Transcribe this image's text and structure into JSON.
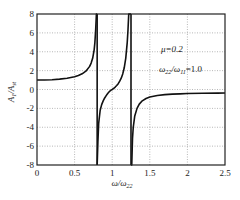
{
  "chart_data": {
    "type": "line",
    "title": "",
    "xlabel": "ω/ω22",
    "ylabel": "A1/Ast",
    "xlim": [
      0,
      2.5
    ],
    "ylim": [
      -8,
      8
    ],
    "xticks": [
      0,
      0.5,
      1,
      1.5,
      2,
      2.5
    ],
    "xtick_labels": [
      "0",
      "0.5",
      "1",
      "1.5",
      "2",
      "2.5"
    ],
    "yticks": [
      -8,
      -6,
      -4,
      -2,
      0,
      2,
      4,
      6,
      8
    ],
    "ytick_labels": [
      "-8",
      "-6",
      "-4",
      "-2",
      "0",
      "2",
      "4",
      "6",
      "8"
    ],
    "grid": true,
    "grid_style": "dotted",
    "legend": null,
    "annotations": [
      {
        "text": "μ=0.2",
        "x": 1.7,
        "y": 3.6
      },
      {
        "text": "ω22/ω11=1.0",
        "x": 1.7,
        "y": 1.3
      }
    ],
    "series": [
      {
        "name": "A1/Ast",
        "color": "#111111",
        "x": [
          0,
          0.1,
          0.2,
          0.3,
          0.4,
          0.5,
          0.55,
          0.6,
          0.65,
          0.7,
          0.72,
          0.74,
          0.76,
          0.77,
          0.78,
          0.79,
          0.8,
          0.8,
          0.81,
          0.82,
          0.84,
          0.86,
          0.88,
          0.9,
          0.92,
          0.94,
          0.96,
          0.98,
          1.0,
          1.02,
          1.04,
          1.06,
          1.08,
          1.1,
          1.12,
          1.14,
          1.16,
          1.18,
          1.2,
          1.21,
          1.22,
          1.23,
          1.24,
          1.25,
          1.25,
          1.26,
          1.27,
          1.28,
          1.3,
          1.33,
          1.36,
          1.4,
          1.45,
          1.5,
          1.6,
          1.7,
          1.8,
          1.9,
          2.0,
          2.2,
          2.4,
          2.5
        ],
        "values": [
          1.0,
          1.01,
          1.04,
          1.1,
          1.2,
          1.36,
          1.48,
          1.66,
          1.94,
          2.45,
          2.8,
          3.3,
          4.2,
          5.0,
          6.3,
          8.0,
          8.0,
          -8.0,
          -5.5,
          -3.6,
          -2.2,
          -1.6,
          -1.2,
          -0.9,
          -0.65,
          -0.42,
          -0.24,
          -0.1,
          0.0,
          0.12,
          0.26,
          0.42,
          0.62,
          0.88,
          1.2,
          1.65,
          2.3,
          3.3,
          5.0,
          6.3,
          8.0,
          8.0,
          8.0,
          8.0,
          -8.0,
          -8.0,
          -5.2,
          -4.0,
          -2.8,
          -2.0,
          -1.55,
          -1.2,
          -0.95,
          -0.8,
          -0.63,
          -0.54,
          -0.49,
          -0.46,
          -0.43,
          -0.4,
          -0.38,
          -0.37
        ]
      }
    ],
    "vertical_segments": [
      {
        "x": 0.8,
        "y_from": 8,
        "y_to": -8
      },
      {
        "x": 1.25,
        "y_from": 8,
        "y_to": -8
      }
    ]
  },
  "labels": {
    "xlabel_main": "ω/ω",
    "xlabel_sub": "22",
    "ylabel_main": "A",
    "ylabel_sub1": "1",
    "ylabel_mid": "/A",
    "ylabel_sub2": "st",
    "anno_mu": "μ=0.2",
    "anno_ratio_main1": "ω",
    "anno_ratio_sub1": "22",
    "anno_ratio_mid": "/ω",
    "anno_ratio_sub2": "11",
    "anno_ratio_tail": "=1.0"
  }
}
